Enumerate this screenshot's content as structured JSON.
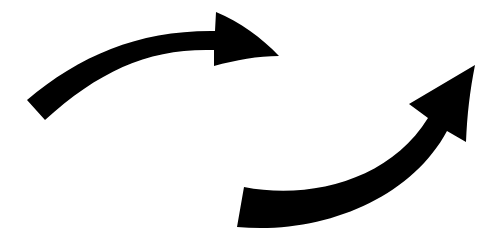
{
  "canvas": {
    "width": 491,
    "height": 249,
    "background": "#ffffff"
  },
  "arrows": [
    {
      "name": "upper-arrow",
      "direction": "right",
      "color": "#000000"
    },
    {
      "name": "lower-arrow",
      "direction": "up-right",
      "color": "#000000"
    }
  ]
}
